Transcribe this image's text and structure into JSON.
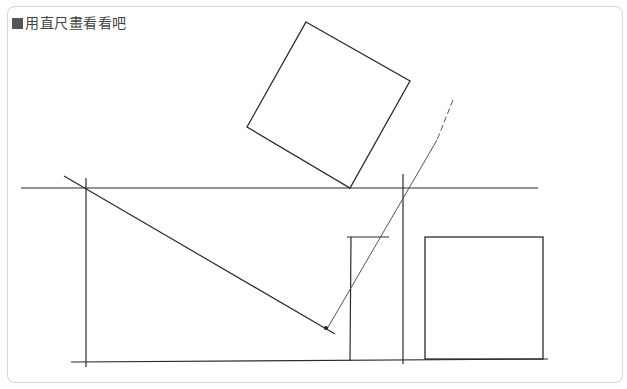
{
  "title": {
    "bullet": "■",
    "text": "用直尺畫看看吧"
  },
  "colors": {
    "stroke": "#2b2b2b",
    "thin_stroke": "#555555",
    "border": "#d6d6d6",
    "title": "#444444"
  },
  "diagram": {
    "lines": [
      {
        "name": "top-horizontal-line",
        "x1": 21,
        "y1": 188,
        "x2": 538,
        "y2": 188
      },
      {
        "name": "bottom-horizontal-line",
        "x1": 71,
        "y1": 362,
        "x2": 548,
        "y2": 359
      },
      {
        "name": "left-vertical-line",
        "x1": 86,
        "y1": 178,
        "x2": 86,
        "y2": 367
      },
      {
        "name": "middle-vertical-line",
        "x1": 403,
        "y1": 174,
        "x2": 403,
        "y2": 364
      },
      {
        "name": "short-vertical-line",
        "x1": 351,
        "y1": 237,
        "x2": 350,
        "y2": 361
      },
      {
        "name": "short-horizontal-line",
        "x1": 347,
        "y1": 237,
        "x2": 389,
        "y2": 237
      },
      {
        "name": "diagonal-line",
        "x1": 64,
        "y1": 176,
        "x2": 335,
        "y2": 334
      },
      {
        "name": "slanted-line",
        "x1": 437,
        "y1": 140,
        "x2": 327,
        "y2": 329
      }
    ],
    "dashed_line": {
      "name": "dashed-guide-line",
      "x1": 453,
      "y1": 100,
      "x2": 437,
      "y2": 140
    },
    "dot": {
      "name": "intersection-dot",
      "cx": 326,
      "cy": 328,
      "r": 2
    },
    "rotated_square": {
      "name": "rotated-square",
      "points": "306,22 410,81 350,188 247,127"
    },
    "upright_square": {
      "name": "upright-square",
      "x": 425,
      "y": 237,
      "width": 118,
      "height": 122
    }
  }
}
